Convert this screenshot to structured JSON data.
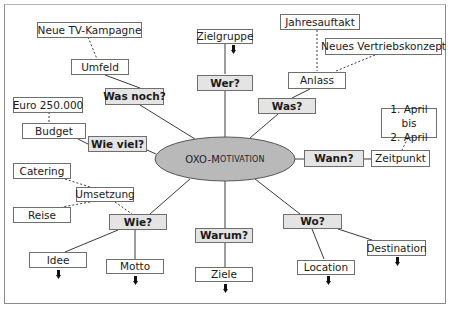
{
  "diagram": {
    "center": {
      "label": "OXO-Motivation",
      "label_prefix": "OXO-M",
      "label_rest": "OTIVATION",
      "fill": "#b9b9b9"
    },
    "question_fill": "#e4e4e4",
    "questions": {
      "was_noch": "Was noch?",
      "wie_viel": "Wie viel?",
      "wer": "Wer?",
      "was": "Was?",
      "wann": "Wann?",
      "wie": "Wie?",
      "warum": "Warum?",
      "wo": "Wo?"
    },
    "topics": {
      "umfeld": "Umfeld",
      "budget": "Budget",
      "zielgruppe": "Zielgruppe",
      "anlass": "Anlass",
      "zeitpunkt": "Zeitpunkt",
      "umsetzung": "Umsetzung",
      "idee": "Idee",
      "motto": "Motto",
      "ziele": "Ziele",
      "location": "Location",
      "destination": "Destination"
    },
    "details": {
      "neue_tv_kampagne": "Neue TV-Kampagne",
      "euro_betrag": "Euro 250.000",
      "jahresauftakt": "Jahresauftakt",
      "neues_vertriebskonzept": "Neues Vertriebskonzept",
      "datum_line1": "1. April bis",
      "datum_line2": "2. April",
      "catering": "Catering",
      "reise": "Reise"
    },
    "arrow_icon": "down-arrow-icon"
  }
}
